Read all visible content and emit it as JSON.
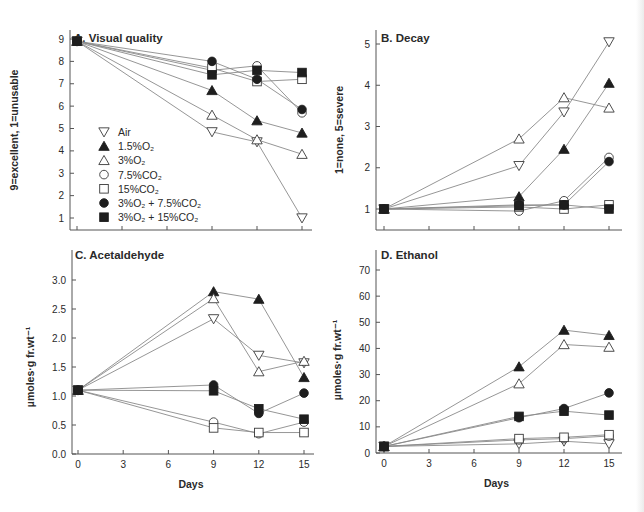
{
  "legend": {
    "items": [
      {
        "key": "air",
        "label": "Air",
        "marker": "triangle-down-open"
      },
      {
        "key": "o2_15",
        "label": "1.5%O₂",
        "marker": "triangle-up-filled"
      },
      {
        "key": "o2_3",
        "label": "3%O₂",
        "marker": "triangle-up-open"
      },
      {
        "key": "co2_75",
        "label": "7.5%CO₂",
        "marker": "circle-open"
      },
      {
        "key": "co2_15",
        "label": "15%CO₂",
        "marker": "square-open"
      },
      {
        "key": "o2_3_co2_75",
        "label": "3%O₂ + 7.5%CO₂",
        "marker": "circle-filled"
      },
      {
        "key": "o2_3_co2_15",
        "label": "3%O₂ + 15%CO₂",
        "marker": "square-filled"
      }
    ]
  },
  "colors": {
    "ink": "#1e1e1e",
    "line": "#8a8a8a",
    "axis": "#555555"
  },
  "chart_data": [
    {
      "id": "A",
      "type": "line",
      "title": "A. Visual quality",
      "xlabel": "",
      "ylabel": "9=excellent, 1=unusable",
      "x": [
        0,
        9,
        12,
        15
      ],
      "xticks": [
        0,
        3,
        6,
        9,
        12,
        15
      ],
      "xtick_labels_visible": false,
      "yticks": [
        1,
        2,
        3,
        4,
        5,
        6,
        7,
        8,
        9
      ],
      "ylim": [
        0.6,
        9.2
      ],
      "series": [
        {
          "name": "Air",
          "values": [
            8.9,
            4.85,
            4.4,
            1.0
          ]
        },
        {
          "name": "1.5%O₂",
          "values": [
            8.9,
            6.7,
            5.35,
            4.8
          ]
        },
        {
          "name": "3%O₂",
          "values": [
            8.9,
            5.6,
            4.5,
            3.85
          ]
        },
        {
          "name": "7.5%CO₂",
          "values": [
            8.9,
            7.6,
            7.8,
            5.7
          ]
        },
        {
          "name": "15%CO₂",
          "values": [
            8.9,
            7.7,
            7.1,
            7.2
          ]
        },
        {
          "name": "3%O₂ + 7.5%CO₂",
          "values": [
            8.9,
            8.0,
            7.2,
            5.85
          ]
        },
        {
          "name": "3%O₂ + 15%CO₂",
          "values": [
            8.9,
            7.4,
            7.6,
            7.5
          ]
        }
      ],
      "legend_position": "lower-left inside"
    },
    {
      "id": "B",
      "type": "line",
      "title": "B. Decay",
      "xlabel": "",
      "ylabel": "1=none, 5=severe",
      "x": [
        0,
        9,
        12,
        15
      ],
      "xticks": [
        0,
        3,
        6,
        9,
        12,
        15
      ],
      "xtick_labels_visible": false,
      "yticks": [
        1,
        2,
        3,
        4,
        5
      ],
      "ylim": [
        0.5,
        5.2
      ],
      "series": [
        {
          "name": "Air",
          "values": [
            1.0,
            2.05,
            3.35,
            5.05
          ]
        },
        {
          "name": "1.5%O₂",
          "values": [
            1.0,
            1.3,
            2.45,
            4.05
          ]
        },
        {
          "name": "3%O₂",
          "values": [
            1.0,
            2.7,
            3.7,
            3.45
          ]
        },
        {
          "name": "7.5%CO₂",
          "values": [
            1.0,
            0.95,
            1.2,
            2.25
          ]
        },
        {
          "name": "15%CO₂",
          "values": [
            1.0,
            1.05,
            1.0,
            1.1
          ]
        },
        {
          "name": "3%O₂ + 7.5%CO₂",
          "values": [
            1.0,
            1.1,
            1.1,
            2.15
          ]
        },
        {
          "name": "3%O₂ + 15%CO₂",
          "values": [
            1.0,
            1.08,
            1.1,
            1.0
          ]
        }
      ]
    },
    {
      "id": "C",
      "type": "line",
      "title": "C. Acetaldehyde",
      "xlabel": "Days",
      "ylabel": "µmoles·g fr.wt⁻¹",
      "x": [
        0,
        9,
        12,
        15
      ],
      "xticks": [
        0,
        3,
        6,
        9,
        12,
        15
      ],
      "yticks": [
        0.0,
        0.5,
        1.0,
        1.5,
        2.0,
        2.5,
        3.0
      ],
      "ytick_labels": [
        "0.0",
        "0.5",
        "1.0",
        "1.5",
        "2.0",
        "2.5",
        "3.0"
      ],
      "ylim": [
        0.0,
        3.2
      ],
      "series": [
        {
          "name": "Air",
          "values": [
            1.1,
            2.33,
            1.7,
            1.57
          ]
        },
        {
          "name": "1.5%O₂",
          "values": [
            1.1,
            2.8,
            2.67,
            1.32
          ]
        },
        {
          "name": "3%O₂",
          "values": [
            1.1,
            2.68,
            1.42,
            1.6
          ]
        },
        {
          "name": "7.5%CO₂",
          "values": [
            1.1,
            0.55,
            0.35,
            0.55
          ]
        },
        {
          "name": "15%CO₂",
          "values": [
            1.1,
            0.45,
            0.37,
            0.37
          ]
        },
        {
          "name": "3%O₂ + 7.5%CO₂",
          "values": [
            1.1,
            1.19,
            0.7,
            1.05
          ]
        },
        {
          "name": "3%O₂ + 15%CO₂",
          "values": [
            1.1,
            1.09,
            0.78,
            0.6
          ]
        }
      ]
    },
    {
      "id": "D",
      "type": "line",
      "title": "D. Ethanol",
      "xlabel": "Days",
      "ylabel": "µmoles·g fr.wt⁻¹",
      "x": [
        0,
        9,
        12,
        15
      ],
      "xticks": [
        0,
        3,
        6,
        9,
        12,
        15
      ],
      "yticks": [
        0,
        10,
        20,
        30,
        40,
        50,
        60,
        70
      ],
      "ylim": [
        0,
        72
      ],
      "series": [
        {
          "name": "Air",
          "values": [
            2.5,
            3.5,
            4.5,
            3.5
          ]
        },
        {
          "name": "1.5%O₂",
          "values": [
            2.5,
            33,
            47,
            45
          ]
        },
        {
          "name": "3%O₂",
          "values": [
            2.5,
            26.5,
            41.5,
            40.5
          ]
        },
        {
          "name": "7.5%CO₂",
          "values": [
            2.5,
            5.0,
            5.5,
            6.5
          ]
        },
        {
          "name": "15%CO₂",
          "values": [
            2.5,
            5.5,
            6.0,
            7.0
          ]
        },
        {
          "name": "3%O₂ + 7.5%CO₂",
          "values": [
            2.5,
            13.5,
            17,
            23
          ]
        },
        {
          "name": "3%O₂ + 15%CO₂",
          "values": [
            2.5,
            14,
            16,
            14.5
          ]
        }
      ]
    }
  ]
}
